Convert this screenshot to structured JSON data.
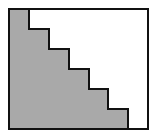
{
  "diagram": {
    "type": "staircase",
    "colors": {
      "fill": "#a9a9a9",
      "stroke": "#111111",
      "background": "#ffffff"
    },
    "frame": {
      "x": 9,
      "y": 9,
      "width": 139,
      "height": 120
    },
    "steps": 6,
    "staircase_points": "9,9 29,9 29,29 49,29 49,49 69,49 69,69 89,69 89,89 108,89 108,109 128,109 128,129 9,129"
  }
}
